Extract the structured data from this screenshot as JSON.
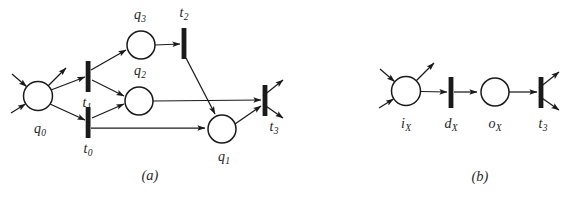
{
  "figure": {
    "type": "petri-net",
    "title_a": "(a)",
    "title_b": "(b)",
    "stroke_color": "#1a1a1a",
    "fill_color": "#ffffff",
    "background": "#ffffff"
  },
  "diagram_a": {
    "caption": "(a)",
    "caption_pos": {
      "x": 150,
      "y": 175
    },
    "places": [
      {
        "id": "q0",
        "label": "q",
        "sub": "0",
        "cx": 38,
        "cy": 96,
        "r": 14.5,
        "label_x": 40,
        "label_y": 130
      },
      {
        "id": "q3",
        "label": "q",
        "sub": "3",
        "cx": 141,
        "cy": 45,
        "r": 14.0,
        "label_x": 140,
        "label_y": 16
      },
      {
        "id": "q2",
        "label": "q",
        "sub": "2",
        "cx": 139,
        "cy": 101,
        "r": 14.0,
        "label_x": 140,
        "label_y": 72
      },
      {
        "id": "q1",
        "label": "q",
        "sub": "1",
        "cx": 222,
        "cy": 129,
        "r": 14.0,
        "label_x": 224,
        "label_y": 158
      }
    ],
    "transitions": [
      {
        "id": "t1",
        "label": "t",
        "sub": "1",
        "cx": 88,
        "cy": 76,
        "w": 4.5,
        "h": 30,
        "label_x": 87,
        "label_y": 104
      },
      {
        "id": "t0",
        "label": "t",
        "sub": "0",
        "cx": 88,
        "cy": 122,
        "w": 4.5,
        "h": 30,
        "label_x": 88,
        "label_y": 150
      },
      {
        "id": "t2",
        "label": "t",
        "sub": "2",
        "cx": 184,
        "cy": 43,
        "w": 4.5,
        "h": 30,
        "label_x": 184,
        "label_y": 14
      },
      {
        "id": "t3",
        "label": "t",
        "sub": "3",
        "cx": 265,
        "cy": 100,
        "w": 4.5,
        "h": 30,
        "label_x": 274,
        "label_y": 128
      }
    ],
    "arcs": [
      {
        "from": "env",
        "to": "q0",
        "desc": "external-input-upper-left"
      },
      {
        "from": "env",
        "to": "q0",
        "desc": "external-input-lower-left"
      },
      {
        "from": "q0",
        "to": "env",
        "desc": "external-output-upper-right"
      },
      {
        "from": "q0",
        "to": "t1",
        "desc": "q0-to-t1"
      },
      {
        "from": "q0",
        "to": "t0",
        "desc": "q0-to-t0"
      },
      {
        "from": "t1",
        "to": "q3",
        "desc": "t1-to-q3"
      },
      {
        "from": "t1",
        "to": "q2",
        "desc": "t1-to-q2"
      },
      {
        "from": "t0",
        "to": "q2",
        "desc": "t0-to-q2"
      },
      {
        "from": "t0",
        "to": "q1",
        "desc": "t0-to-q1"
      },
      {
        "from": "q3",
        "to": "t2",
        "desc": "q3-to-t2"
      },
      {
        "from": "t2",
        "to": "q1",
        "desc": "t2-to-q1"
      },
      {
        "from": "q2",
        "to": "t3",
        "desc": "q2-to-t3"
      },
      {
        "from": "q1",
        "to": "t3",
        "desc": "q1-to-t3"
      },
      {
        "from": "t3",
        "to": "env",
        "desc": "external-output-upper-right"
      },
      {
        "from": "t3",
        "to": "env",
        "desc": "external-output-lower-right"
      }
    ]
  },
  "diagram_b": {
    "caption": "(b)",
    "caption_pos": {
      "x": 480,
      "y": 176
    },
    "places": [
      {
        "id": "iX",
        "label": "i",
        "sub": "X",
        "cx": 406,
        "cy": 91,
        "r": 14.5,
        "label_x": 406,
        "label_y": 125
      },
      {
        "id": "oX",
        "label": "o",
        "sub": "X",
        "cx": 495,
        "cy": 92,
        "r": 14.0,
        "label_x": 495,
        "label_y": 125
      }
    ],
    "transitions": [
      {
        "id": "dX",
        "label": "d",
        "sub": "X",
        "cx": 451,
        "cy": 92,
        "w": 4.5,
        "h": 30,
        "label_x": 451,
        "label_y": 125
      },
      {
        "id": "t3",
        "label": "t",
        "sub": "3",
        "cx": 541,
        "cy": 92,
        "w": 4.5,
        "h": 30,
        "label_x": 543,
        "label_y": 125
      }
    ],
    "arcs": [
      {
        "from": "env",
        "to": "iX",
        "desc": "external-input-upper-left"
      },
      {
        "from": "env",
        "to": "iX",
        "desc": "external-input-lower-left"
      },
      {
        "from": "iX",
        "to": "env",
        "desc": "external-output-upper-right"
      },
      {
        "from": "iX",
        "to": "dX",
        "desc": "iX-to-dX"
      },
      {
        "from": "dX",
        "to": "oX",
        "desc": "dX-to-oX"
      },
      {
        "from": "oX",
        "to": "t3",
        "desc": "oX-to-t3"
      },
      {
        "from": "t3",
        "to": "env",
        "desc": "external-output-upper-right"
      },
      {
        "from": "t3",
        "to": "env",
        "desc": "external-output-lower-right"
      }
    ]
  }
}
